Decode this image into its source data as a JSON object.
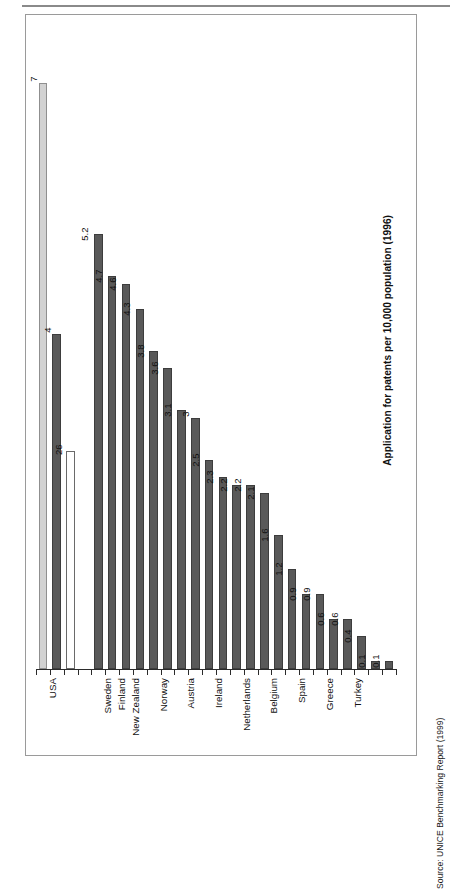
{
  "figure": {
    "title": "Figure 5.2 International comparisons of patent numbers",
    "source": "Source: UNICE Benchmarking Report (1999)"
  },
  "chart_data": {
    "type": "bar",
    "title": "Figure 5.2 International comparisons of patent numbers",
    "xlabel": "",
    "ylabel": "Application for patents per 10,000 population (1996)",
    "orientation": "rotated-90-counterclockwise",
    "grid": false,
    "legend": null,
    "ylim": [
      0,
      7.6
    ],
    "categories": [
      "USA",
      "",
      "",
      "",
      "Sweden",
      "Finland",
      "New Zealand",
      "",
      "Norway",
      "Austria",
      "",
      "Ireland",
      "",
      "Netherlands",
      "",
      "Belgium",
      "",
      "Spain",
      "",
      "Greece",
      "",
      "Turkey"
    ],
    "bars": [
      {
        "label": "USA",
        "value": 7,
        "display": "7",
        "style": "light"
      },
      {
        "label": "",
        "value": 4,
        "display": "4",
        "style": "dark"
      },
      {
        "label": "",
        "value": 2.6,
        "display": "26",
        "style": "hollow"
      },
      {
        "label": "",
        "value": null,
        "display": "",
        "style": "none"
      },
      {
        "label": "Sweden",
        "value": 5.2,
        "display": "5.2",
        "style": "dark"
      },
      {
        "label": "Finland",
        "value": 4.7,
        "display": "4.7",
        "style": "dark"
      },
      {
        "label": "New Zealand",
        "value": 4.6,
        "display": "4.6",
        "style": "dark"
      },
      {
        "label": "",
        "value": 4.3,
        "display": "4.3",
        "style": "dark"
      },
      {
        "label": "Norway",
        "value": 3.8,
        "display": "3.8",
        "style": "dark"
      },
      {
        "label": "Austria",
        "value": 3.6,
        "display": "3.6",
        "style": "dark"
      },
      {
        "label": "",
        "value": 3.1,
        "display": "3.1",
        "style": "dark"
      },
      {
        "label": "Ireland",
        "value": 3,
        "display": "3",
        "style": "dark"
      },
      {
        "label": "",
        "value": 2.5,
        "display": "2.5",
        "style": "dark"
      },
      {
        "label": "Netherlands",
        "value": 2.3,
        "display": "2.3",
        "style": "dark"
      },
      {
        "label": "",
        "value": 2.2,
        "display": "2.2",
        "style": "dark"
      },
      {
        "label": "Belgium",
        "value": 2.2,
        "display": "2.2",
        "style": "dark"
      },
      {
        "label": "",
        "value": 2.1,
        "display": "2.1",
        "style": "dark"
      },
      {
        "label": "Spain",
        "value": 1.6,
        "display": "1.6",
        "style": "dark"
      },
      {
        "label": "",
        "value": 1.2,
        "display": "1.2",
        "style": "dark"
      },
      {
        "label": "Greece",
        "value": 0.9,
        "display": "0.9",
        "style": "dark"
      },
      {
        "label": "",
        "value": 0.9,
        "display": "0.9",
        "style": "dark"
      },
      {
        "label": "Turkey",
        "value": 0.6,
        "display": "0.6",
        "style": "dark"
      },
      {
        "label": "",
        "value": 0.6,
        "display": "0.6",
        "style": "dark"
      },
      {
        "label": "",
        "value": 0.4,
        "display": "0.4",
        "style": "dark"
      },
      {
        "label": "",
        "value": 0.1,
        "display": "0.1",
        "style": "dark"
      },
      {
        "label": "",
        "value": 0.1,
        "display": "0.1",
        "style": "dark"
      }
    ],
    "tick_labels": [
      {
        "text": "USA",
        "bar_index": 0
      },
      {
        "text": "Sweden",
        "bar_index": 4
      },
      {
        "text": "Finland",
        "bar_index": 5
      },
      {
        "text": "New Zealand",
        "bar_index": 6
      },
      {
        "text": "Norway",
        "bar_index": 8
      },
      {
        "text": "Austria",
        "bar_index": 10
      },
      {
        "text": "Ireland",
        "bar_index": 12
      },
      {
        "text": "Netherlands",
        "bar_index": 14
      },
      {
        "text": "Belgium",
        "bar_index": 16
      },
      {
        "text": "Spain",
        "bar_index": 18
      },
      {
        "text": "Greece",
        "bar_index": 20
      },
      {
        "text": "Turkey",
        "bar_index": 22
      }
    ],
    "colors": {
      "dark": "#595959",
      "light": "#d2d2d2",
      "hollow": "#ffffff",
      "outline": "#3d3d3d",
      "axis": "#2b2b2b",
      "text": "#111111"
    }
  }
}
